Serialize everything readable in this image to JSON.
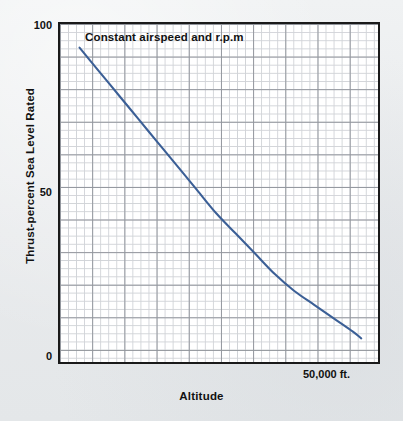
{
  "chart_data": {
    "type": "line",
    "title": "Constant airspeed and r.p.m",
    "xlabel": "Altitude",
    "ylabel": "Thrust-percent Sea Level Rated",
    "ytick_labels": [
      "100",
      "50",
      "0"
    ],
    "ytick_values": [
      100,
      50,
      0
    ],
    "xtick_labels": [
      "50,000 ft."
    ],
    "xtick_values": [
      50000
    ],
    "ylim": [
      0,
      100
    ],
    "xlim": [
      0,
      57000
    ],
    "grid": true,
    "grid_minor": true,
    "legend": "none",
    "series": [
      {
        "name": "Thrust",
        "color": "#3b5f96",
        "x": [
          3500,
          7000,
          10500,
          14000,
          17500,
          21000,
          24500,
          28000,
          31500,
          35000,
          38500,
          42000,
          45500,
          49000,
          52500,
          54000
        ],
        "values": [
          93,
          86,
          79,
          72,
          65,
          58,
          51,
          44,
          38,
          32,
          26,
          21,
          17,
          13,
          9,
          7
        ]
      }
    ]
  },
  "colors": {
    "page_background": "#eceef0",
    "plot_background": "#ffffff",
    "frame": "#1a1a1a",
    "grid_minor": "#c9ccd1",
    "grid_major": "#8f939a",
    "curve": "#3b5f96",
    "text": "#111111"
  }
}
